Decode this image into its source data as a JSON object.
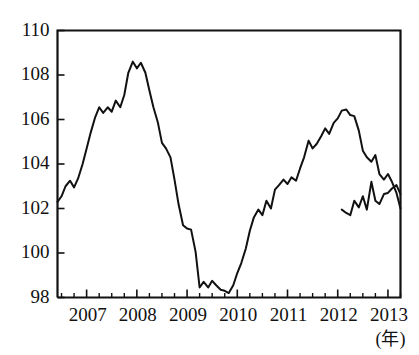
{
  "chart_data": {
    "type": "line",
    "title": "",
    "subtitle": "",
    "xlabel": "(年)",
    "ylabel": "",
    "xlim": [
      2006.42,
      2013.25
    ],
    "ylim": [
      98,
      110
    ],
    "grid": false,
    "legend": null,
    "y_ticks": [
      98,
      100,
      102,
      104,
      106,
      108,
      110
    ],
    "y_tick_labels": [
      "98",
      "100",
      "102",
      "104",
      "106",
      "108",
      "110"
    ],
    "x_ticks": [
      2007,
      2008,
      2009,
      2010,
      2011,
      2012,
      2013
    ],
    "x_tick_labels": [
      "2007",
      "2008",
      "2009",
      "2010",
      "2011",
      "2012",
      "2013"
    ],
    "x_minor_ticks_per_year": 4,
    "series": [
      {
        "name": "index",
        "color": "#111111",
        "x": [
          2006.42,
          2006.5,
          2006.58,
          2006.67,
          2006.75,
          2006.83,
          2006.92,
          2007.0,
          2007.08,
          2007.17,
          2007.25,
          2007.33,
          2007.42,
          2007.5,
          2007.58,
          2007.67,
          2007.75,
          2007.83,
          2007.92,
          2008.0,
          2008.08,
          2008.17,
          2008.25,
          2008.33,
          2008.42,
          2008.5,
          2008.58,
          2008.67,
          2008.75,
          2008.83,
          2008.92,
          2009.0,
          2009.08,
          2009.17,
          2009.25,
          2009.33,
          2009.42,
          2009.5,
          2009.58,
          2009.67,
          2009.75,
          2009.83,
          2009.92,
          2010.0,
          2010.08,
          2010.17,
          2010.25,
          2010.33,
          2010.42,
          2010.5,
          2010.58,
          2010.67,
          2010.75,
          2010.83,
          2010.92,
          2011.0,
          2011.08,
          2011.17,
          2011.25,
          2011.33,
          2011.42,
          2011.5,
          2011.58,
          2011.67,
          2011.75,
          2011.83,
          2011.92,
          2012.0,
          2012.08,
          2012.17,
          2012.25,
          2012.33,
          2012.42,
          2012.5,
          2012.58,
          2012.67,
          2012.75,
          2012.83,
          2012.92,
          2013.0,
          2013.08,
          2013.17,
          2013.25
        ],
        "y": [
          102.3,
          102.55,
          103.0,
          103.25,
          102.95,
          103.35,
          104.0,
          104.7,
          105.4,
          106.1,
          106.55,
          106.3,
          106.55,
          106.35,
          106.85,
          106.55,
          107.1,
          108.1,
          108.6,
          108.3,
          108.55,
          108.1,
          107.3,
          106.55,
          105.85,
          104.95,
          104.7,
          104.3,
          103.3,
          102.2,
          101.25,
          101.1,
          101.05,
          100.05,
          98.45,
          98.7,
          98.45,
          98.75,
          98.55,
          98.35,
          98.3,
          98.2,
          98.55,
          99.1,
          99.55,
          100.2,
          101.0,
          101.6,
          101.95,
          101.7,
          102.35,
          102.0,
          102.85,
          103.05,
          103.3,
          103.1,
          103.4,
          103.25,
          103.8,
          104.3,
          105.05,
          104.7,
          104.9,
          105.25,
          105.6,
          105.35,
          105.85,
          106.05,
          106.4,
          106.45,
          106.2,
          106.15,
          105.5,
          104.6,
          104.3,
          104.1,
          104.4,
          103.55,
          103.3,
          103.55,
          103.2,
          102.7,
          102.0
        ]
      }
    ],
    "series_tail": {
      "name": "index-continued",
      "x": [
        2012.08,
        2012.17,
        2012.25,
        2012.33,
        2012.42,
        2012.5,
        2012.58,
        2012.67,
        2012.75,
        2012.83,
        2012.92,
        2013.0,
        2013.08,
        2013.17,
        2013.25
      ],
      "y": [
        101.95,
        101.8,
        101.7,
        102.35,
        102.05,
        102.55,
        101.95,
        103.2,
        102.35,
        102.2,
        102.65,
        102.7,
        102.9,
        103.05,
        102.65
      ]
    },
    "annotations": [
      {
        "name": "x-axis-unit",
        "text": "(年)",
        "x": 2013.05,
        "y": 97.2
      }
    ],
    "notes": {
      "peak_1_value": 108.6,
      "peak_1_date": "2007.92",
      "trough_value": 98.2,
      "trough_date": "2009.83",
      "peak_2_value": 106.45,
      "peak_2_date": "2011.17",
      "start_value": 102.3,
      "end_value": 102.65
    }
  }
}
